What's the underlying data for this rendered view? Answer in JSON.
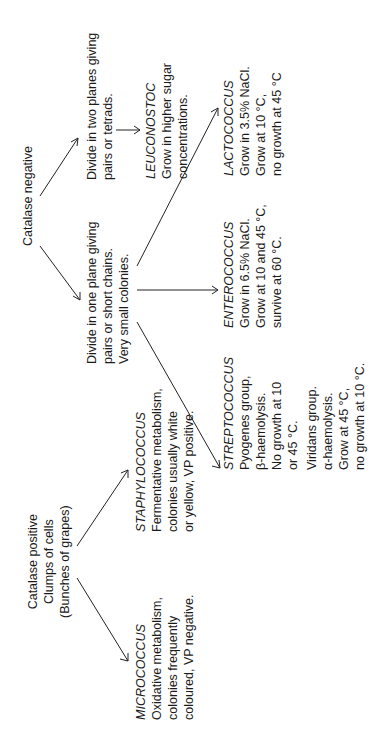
{
  "catalase_negative": {
    "title": "Catalase negative",
    "two_planes": {
      "lines": [
        "Divide in two planes giving",
        "pairs or tetrads."
      ],
      "leuconostoc": {
        "genus": "LEUCONOSTOC",
        "lines": [
          "Grow in higher sugar",
          "concentrations."
        ]
      }
    },
    "one_plane": {
      "lines": [
        "Divide in one plane giving",
        "pairs or short chains.",
        "Very small colonies."
      ],
      "streptococcus": {
        "genus": "STREPTOCOCCUS",
        "lines": [
          "Pyogenes group,",
          "β-haemolysis.",
          "No growth at 10",
          "or 45 °C."
        ],
        "viridans_lines": [
          "Viridans group.",
          "α-haemolysis.",
          "Grow at 45 °C,",
          "no growth at 10 °C."
        ]
      },
      "enterococcus": {
        "genus": "ENTEROCOCCUS",
        "lines": [
          "Grow in 6.5% NaCl.",
          "Grow at 10 and 45 °C,",
          "survive at 60 °C."
        ]
      },
      "lactococcus": {
        "genus": "LACTOCOCCUS",
        "lines": [
          "Grow in 3.5% NaCl.",
          "Grow at 10 °C,",
          "no growth at 45 °C"
        ]
      }
    }
  },
  "catalase_positive": {
    "lines": [
      "Catalase positive",
      "Clumps of cells",
      "(Bunches of grapes)"
    ],
    "micrococcus": {
      "genus": "MICROCOCCUS",
      "lines": [
        "Oxidative metabolism,",
        "colonies frequently",
        "coloured, VP negative."
      ]
    },
    "staphylococcus": {
      "genus": "STAPHYLOCOCCUS",
      "lines": [
        "Fermentative metabolism,",
        "colonies usually white",
        "or yellow, VP positive."
      ]
    }
  }
}
